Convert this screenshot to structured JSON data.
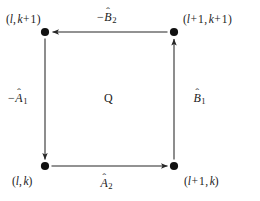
{
  "diagram": {
    "type": "commutative-square",
    "background_color": "#ffffff",
    "stroke_color": "#262626",
    "text_color": "#1a1a1a",
    "region": {
      "label": "Q"
    },
    "vertices": [
      {
        "id": "top-left",
        "label": "(l, k + 1)",
        "parts": {
          "open": "(",
          "first": "l",
          "comma": ",",
          "second": "k",
          "op": "+",
          "offset": "1",
          "close": ")"
        },
        "x": 45,
        "y": 32
      },
      {
        "id": "top-right",
        "label": "(l + 1, k + 1)",
        "parts": {
          "open": "(",
          "first": "l",
          "op1": "+",
          "offset1": "1",
          "comma": ",",
          "second": "k",
          "op2": "+",
          "offset2": "1",
          "close": ")"
        },
        "x": 174,
        "y": 32
      },
      {
        "id": "bottom-left",
        "label": "(l, k)",
        "parts": {
          "open": "(",
          "first": "l",
          "comma": ",",
          "second": "k",
          "close": ")"
        },
        "x": 45,
        "y": 166
      },
      {
        "id": "bottom-right",
        "label": "(l + 1, k)",
        "parts": {
          "open": "(",
          "first": "l",
          "op1": "+",
          "offset1": "1",
          "comma": ",",
          "second": "k",
          "close": ")"
        },
        "x": 174,
        "y": 166
      }
    ],
    "edges": [
      {
        "id": "edge-top",
        "from": "top-right",
        "to": "top-left",
        "direction": "left",
        "label": "-B̂2",
        "sign": "−",
        "symbol": "B",
        "hat": "̂",
        "subscript": "2"
      },
      {
        "id": "edge-left",
        "from": "top-left",
        "to": "bottom-left",
        "direction": "down",
        "label": "-Â1",
        "sign": "−",
        "symbol": "A",
        "hat": "̂",
        "subscript": "1"
      },
      {
        "id": "edge-bottom",
        "from": "bottom-left",
        "to": "bottom-right",
        "direction": "right",
        "label": "Â2",
        "sign": "",
        "symbol": "A",
        "hat": "̂",
        "subscript": "2"
      },
      {
        "id": "edge-right",
        "from": "bottom-right",
        "to": "top-right",
        "direction": "up",
        "label": "B̂1",
        "sign": "",
        "symbol": "B",
        "hat": "̂",
        "subscript": "1"
      }
    ]
  }
}
